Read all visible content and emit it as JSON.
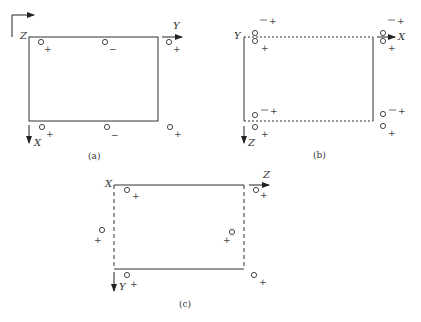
{
  "figure": {
    "panels": [
      {
        "id": "a",
        "caption": "(a)",
        "axes": {
          "origin": "Z",
          "horizontal": "Y",
          "vertical": "X"
        },
        "edges": {
          "top": "solid",
          "bottom": "solid",
          "left": "solid",
          "right": "solid"
        },
        "markers": [
          {
            "pos": "top-left",
            "sign": "+"
          },
          {
            "pos": "top-mid",
            "sign": "−"
          },
          {
            "pos": "top-right",
            "sign": "+"
          },
          {
            "pos": "bottom-left",
            "sign": "+"
          },
          {
            "pos": "bottom-mid",
            "sign": "−"
          },
          {
            "pos": "bottom-right",
            "sign": "+"
          }
        ]
      },
      {
        "id": "b",
        "caption": "(b)",
        "axes": {
          "origin": "Y",
          "horizontal": "X",
          "vertical": "Z"
        },
        "edges": {
          "top": "dashed",
          "bottom": "dashed",
          "left": "solid",
          "right": "solid"
        },
        "fraction": {
          "num": "1",
          "den": "2"
        },
        "markers": [
          {
            "pos": "top-left",
            "upper": "1/2 +",
            "lower": "+"
          },
          {
            "pos": "top-right",
            "upper": "1/2 +",
            "lower": "+"
          },
          {
            "pos": "bottom-left",
            "upper": "1/2 +",
            "lower": "+"
          },
          {
            "pos": "bottom-right",
            "upper": "1/2 +",
            "lower": "+"
          }
        ]
      },
      {
        "id": "c",
        "caption": "(c)",
        "axes": {
          "origin": "X",
          "horizontal": "Z",
          "vertical": "Y"
        },
        "edges": {
          "top": "solid",
          "bottom": "solid",
          "left": "dashed",
          "right": "dashed"
        },
        "markers": [
          {
            "pos": "top-left",
            "sign": "+"
          },
          {
            "pos": "top-right",
            "sign": "+"
          },
          {
            "pos": "mid-left",
            "sign": "+"
          },
          {
            "pos": "mid-right",
            "sign": "+"
          },
          {
            "pos": "bottom-left",
            "sign": "+"
          },
          {
            "pos": "bottom-right",
            "sign": "+"
          }
        ]
      }
    ]
  }
}
